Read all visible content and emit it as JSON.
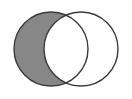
{
  "figure": {
    "type": "venn-diagram",
    "title": "",
    "caption": "",
    "width": 132,
    "height": 99,
    "background_color": "#ffffff"
  },
  "chart_data": {
    "type": "venn",
    "title": "",
    "xlabel": "",
    "ylabel": "",
    "sets": [
      {
        "name": "left-set",
        "label": "",
        "center_x": 51,
        "center_y": 49,
        "radius": 37,
        "fill": "none",
        "stroke": "#3a3a3a"
      },
      {
        "name": "right-set",
        "label": "",
        "center_x": 81,
        "center_y": 49,
        "radius": 37,
        "fill": "none",
        "stroke": "#3a3a3a"
      }
    ],
    "shaded_regions": [
      {
        "name": "left-only",
        "description": "left circle excluding intersection",
        "fill": "#878787",
        "shaded": true
      },
      {
        "name": "intersection",
        "description": "overlap of both circles",
        "fill": "#ffffff",
        "shaded": false
      },
      {
        "name": "right-only",
        "description": "right circle excluding intersection",
        "fill": "#ffffff",
        "shaded": false
      }
    ],
    "intersection_points": [
      {
        "x": 66,
        "y": 14
      },
      {
        "x": 66,
        "y": 84
      }
    ],
    "annotations": [],
    "legend": {
      "entries": [],
      "position": "none"
    },
    "grid": false
  },
  "colors": {
    "shade_gray": "#878787",
    "outline": "#3a3a3a",
    "background": "#ffffff"
  },
  "labels": {
    "left_circle": "",
    "right_circle": "",
    "overlap": ""
  }
}
